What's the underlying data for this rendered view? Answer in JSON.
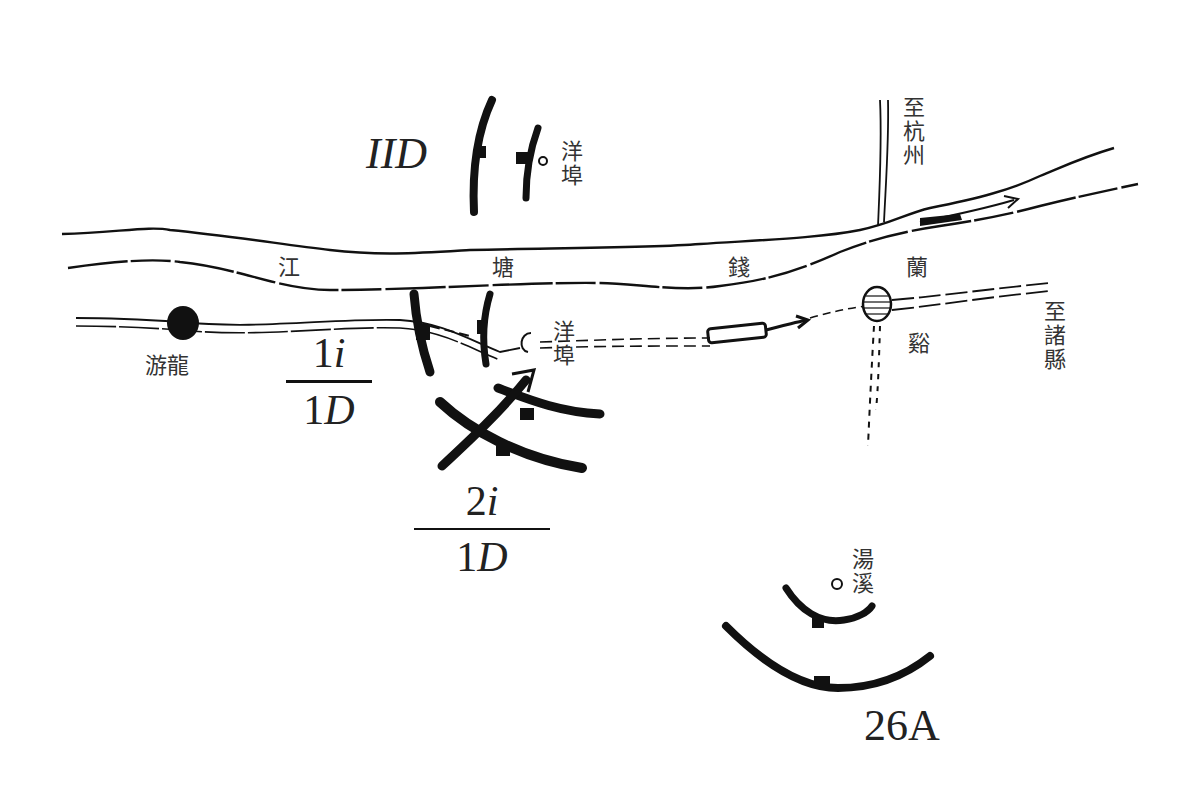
{
  "map": {
    "river": {
      "label_chars": [
        "江",
        "塘",
        "錢"
      ]
    },
    "places": {
      "yangbu_north": "洋埠",
      "yangbu_south": "洋埠",
      "youlong": "游龍",
      "lanxi_top": "蘭",
      "lanxi_bottom": "谿",
      "tangxi": "湯溪",
      "to_hangzhou": "至杭州",
      "to_zhuxian": "至諸縣"
    },
    "units": {
      "north": "IID",
      "southeast": "26A",
      "frac1": {
        "num_digit": "1",
        "num_letter": "i",
        "den_digit": "1",
        "den_letter": "D"
      },
      "frac2": {
        "num_digit": "2",
        "num_letter": "i",
        "den_digit": "1",
        "den_letter": "D"
      }
    },
    "colors": {
      "ink": "#111111",
      "text": "#333333",
      "paper": "#ffffff"
    }
  }
}
